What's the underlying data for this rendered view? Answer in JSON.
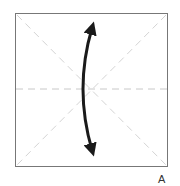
{
  "diagram": {
    "type": "origami-fold-step",
    "step_label": "A",
    "paper": {
      "x": 15,
      "y": 13,
      "width": 152,
      "height": 153,
      "border_color": "#777777",
      "fill": "#ffffff"
    },
    "crease_lines": [
      {
        "name": "horizontal-crease",
        "style": "dashed",
        "color": "#c8c8c8"
      },
      {
        "name": "diagonal-crease-1",
        "style": "dashed",
        "color": "#d0d0d0"
      },
      {
        "name": "diagonal-crease-2",
        "style": "dashed",
        "color": "#d0d0d0"
      }
    ],
    "arrow": {
      "type": "double-headed-curved",
      "color": "#1a1a1a",
      "meaning": "fold and unfold vertically"
    }
  }
}
